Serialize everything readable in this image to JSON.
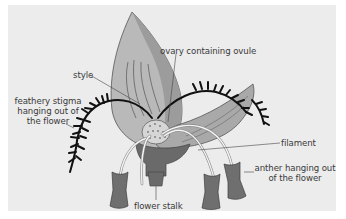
{
  "diagram": {
    "background_color": "#ececec",
    "label_color": "#3a3a3a",
    "labels": {
      "ovary": "ovary containing ovule",
      "style": "style",
      "stigma_line1": "feathery stigma",
      "stigma_line2": "hanging out of",
      "stigma_line3": "the flower",
      "filament": "filament",
      "anther_line1": "anther hanging out",
      "anther_line2": "of the flower",
      "stalk": "flower stalk"
    }
  }
}
